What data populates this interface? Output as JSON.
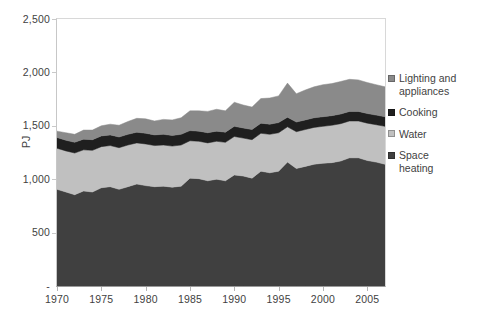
{
  "chart_data": {
    "type": "area",
    "stacked": true,
    "title": "",
    "xlabel": "",
    "ylabel": "PJ",
    "ylim": [
      0,
      2500
    ],
    "xlim": [
      1970,
      2007
    ],
    "grid": false,
    "legend_position": "right",
    "y_ticks": [
      0,
      500,
      1000,
      1500,
      2000,
      2500
    ],
    "y_tick_labels": [
      "-",
      "500",
      "1,000",
      "1,500",
      "2,000",
      "2,500"
    ],
    "x_ticks": [
      1970,
      1975,
      1980,
      1985,
      1990,
      1995,
      2000,
      2005
    ],
    "x_tick_labels": [
      "1970",
      "1975",
      "1980",
      "1985",
      "1990",
      "1995",
      "2000",
      "2005"
    ],
    "x": [
      1970,
      1971,
      1972,
      1973,
      1974,
      1975,
      1976,
      1977,
      1978,
      1979,
      1980,
      1981,
      1982,
      1983,
      1984,
      1985,
      1986,
      1987,
      1988,
      1989,
      1990,
      1991,
      1992,
      1993,
      1994,
      1995,
      1996,
      1997,
      1998,
      1999,
      2000,
      2001,
      2002,
      2003,
      2004,
      2005,
      2006,
      2007
    ],
    "series": [
      {
        "name": "Space heating",
        "color": "#404040",
        "stack_order": 1,
        "values": [
          905,
          880,
          855,
          890,
          880,
          920,
          930,
          905,
          930,
          955,
          940,
          930,
          935,
          925,
          935,
          1010,
          1005,
          985,
          1000,
          985,
          1040,
          1030,
          1010,
          1075,
          1060,
          1075,
          1160,
          1100,
          1120,
          1140,
          1150,
          1155,
          1170,
          1200,
          1200,
          1175,
          1160,
          1140
        ]
      },
      {
        "name": "Water",
        "color": "#c0c0c0",
        "stack_order": 2,
        "values": [
          385,
          385,
          390,
          385,
          390,
          385,
          385,
          390,
          390,
          385,
          390,
          385,
          385,
          385,
          385,
          350,
          350,
          355,
          355,
          360,
          360,
          355,
          360,
          355,
          360,
          360,
          330,
          345,
          345,
          345,
          345,
          350,
          350,
          345,
          345,
          350,
          350,
          355
        ]
      },
      {
        "name": "Cooking",
        "color": "#1f1f1f",
        "stack_order": 3,
        "values": [
          100,
          100,
          100,
          100,
          100,
          100,
          100,
          100,
          100,
          100,
          100,
          100,
          100,
          100,
          100,
          95,
          95,
          95,
          95,
          95,
          95,
          95,
          95,
          95,
          95,
          95,
          90,
          90,
          90,
          90,
          90,
          90,
          90,
          90,
          90,
          90,
          90,
          90
        ]
      },
      {
        "name": "Lighting and appliances",
        "color": "#8a8a8a",
        "stack_order": 4,
        "values": [
          60,
          70,
          75,
          85,
          90,
          95,
          100,
          110,
          120,
          130,
          135,
          130,
          140,
          145,
          155,
          185,
          190,
          200,
          205,
          200,
          225,
          215,
          210,
          230,
          245,
          250,
          320,
          265,
          280,
          290,
          300,
          300,
          305,
          300,
          295,
          290,
          285,
          280
        ]
      }
    ],
    "totals": [
      1450,
      1435,
      1420,
      1460,
      1460,
      1500,
      1515,
      1505,
      1540,
      1570,
      1565,
      1545,
      1560,
      1555,
      1575,
      1640,
      1640,
      1635,
      1655,
      1640,
      1720,
      1695,
      1675,
      1755,
      1760,
      1780,
      1900,
      1800,
      1835,
      1865,
      1885,
      1895,
      1915,
      1935,
      1930,
      1905,
      1885,
      1865
    ]
  },
  "legend": {
    "items": [
      {
        "label": "Lighting and\nappliances",
        "color": "#8a8a8a",
        "name": "lighting-and-appliances"
      },
      {
        "label": "Cooking",
        "color": "#1f1f1f",
        "name": "cooking"
      },
      {
        "label": "Water",
        "color": "#c0c0c0",
        "name": "water"
      },
      {
        "label": "Space\nheating",
        "color": "#404040",
        "name": "space-heating"
      }
    ]
  },
  "axes": {
    "y_title": "PJ"
  }
}
